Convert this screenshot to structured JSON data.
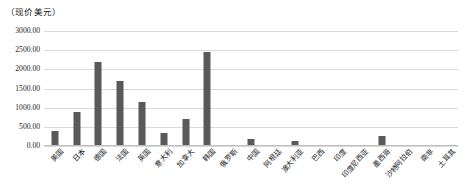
{
  "chart_data": {
    "type": "bar",
    "title": "",
    "axis_unit_label": "（现价美元）",
    "xlabel": "",
    "ylabel": "",
    "ylim": [
      0,
      3000
    ],
    "ytick_values": [
      3000,
      2500,
      2000,
      1500,
      1000,
      500,
      0
    ],
    "ytick_labels": [
      "3000.00",
      "2500.00",
      "2000.00",
      "1500.00",
      "1000.00",
      "500.00",
      "0.00"
    ],
    "grid": true,
    "legend": "none",
    "bar_color": "#595959",
    "gridline_color": "#d9d9d9",
    "categories": [
      "美国",
      "日本",
      "德国",
      "法国",
      "英国",
      "意大利",
      "加拿大",
      "韩国",
      "俄罗斯",
      "中国",
      "阿根廷",
      "澳大利亚",
      "巴西",
      "印度",
      "印度尼西亚",
      "墨西哥",
      "沙特阿拉伯",
      "南非",
      "土耳其"
    ],
    "values": [
      400,
      900,
      2200,
      1700,
      1150,
      350,
      700,
      2450,
      30,
      190,
      20,
      120,
      15,
      10,
      8,
      250,
      5,
      12,
      10
    ]
  }
}
